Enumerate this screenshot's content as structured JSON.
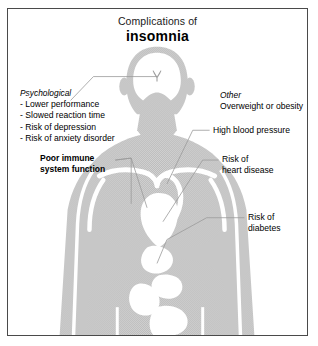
{
  "figure": {
    "title_line1": "Complications of",
    "title_line2": "insomnia",
    "border_color": "#4a4a4a",
    "background_color": "#ffffff",
    "body_fill_color": "#c9c9c9",
    "organ_fill_color": "#ffffff",
    "leader_line_color": "#9a9a9a",
    "text_color": "#000000"
  },
  "annotations": {
    "psychological": {
      "heading": "Psychological",
      "items": [
        "- Lower performance",
        "- Slowed reaction time",
        "- Risk of depression",
        "- Risk of anxiety disorder"
      ]
    },
    "immune": {
      "line1": "Poor immune",
      "line2": "system function"
    },
    "other": {
      "heading": "Other",
      "item": "Overweight or obesity"
    },
    "blood_pressure": {
      "line1": "High blood pressure"
    },
    "heart": {
      "line1": "Risk of",
      "line2": "heart disease"
    },
    "diabetes": {
      "line1": "Risk of",
      "line2": "diabetes"
    }
  }
}
